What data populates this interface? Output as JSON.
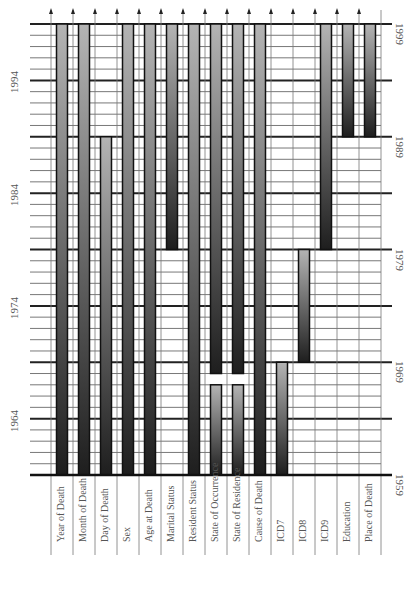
{
  "chart_data": {
    "type": "bar",
    "orientation": "vertical-timeline (rotated page)",
    "title": "",
    "xlabel": "",
    "ylabel": "Year",
    "ylim": [
      1959,
      1999
    ],
    "grid": true,
    "major_tick_every": 5,
    "y_tick_labels_left": [
      "1964",
      "1974",
      "1984",
      "1994"
    ],
    "y_tick_labels_right": [
      "1959",
      "1969",
      "1979",
      "1989",
      "1999"
    ],
    "categories": [
      "Year of Death",
      "Month of Death",
      "Day of Death",
      "Sex",
      "Age at Death",
      "Marital Status",
      "Resident Status",
      "State of Occurrence",
      "State of Residence",
      "Cause of Death",
      "ICD7",
      "ICD8",
      "ICD9",
      "Education",
      "Place of Death"
    ],
    "series": [
      {
        "name": "Year of Death",
        "spans": [
          [
            1959,
            1999
          ]
        ]
      },
      {
        "name": "Month of Death",
        "spans": [
          [
            1959,
            1999
          ]
        ]
      },
      {
        "name": "Day of Death",
        "spans": [
          [
            1959,
            1989
          ]
        ]
      },
      {
        "name": "Sex",
        "spans": [
          [
            1959,
            1999
          ]
        ]
      },
      {
        "name": "Age at Death",
        "spans": [
          [
            1959,
            1999
          ]
        ]
      },
      {
        "name": "Marital Status",
        "spans": [
          [
            1979,
            1999
          ]
        ]
      },
      {
        "name": "Resident Status",
        "spans": [
          [
            1959,
            1999
          ]
        ]
      },
      {
        "name": "State of Occurrence",
        "spans": [
          [
            1959,
            1967
          ],
          [
            1968,
            1999
          ]
        ]
      },
      {
        "name": "State of Residence",
        "spans": [
          [
            1959,
            1967
          ],
          [
            1968,
            1999
          ]
        ]
      },
      {
        "name": "Cause of Death",
        "spans": [
          [
            1959,
            1999
          ]
        ]
      },
      {
        "name": "ICD7",
        "spans": [
          [
            1959,
            1969
          ]
        ]
      },
      {
        "name": "ICD8",
        "spans": [
          [
            1969,
            1979
          ]
        ]
      },
      {
        "name": "ICD9",
        "spans": [
          [
            1979,
            1999
          ]
        ]
      },
      {
        "name": "Education",
        "spans": [
          [
            1989,
            1999
          ]
        ]
      },
      {
        "name": "Place of Death",
        "spans": [
          [
            1989,
            1999
          ]
        ]
      }
    ],
    "colors": {
      "bar_top": "#b4b4b4",
      "bar_bottom": "#1e1e1e",
      "bar_border": "#111111",
      "grid_major": "#222222",
      "grid_minor": "#555555",
      "label_text": "#555555"
    }
  }
}
